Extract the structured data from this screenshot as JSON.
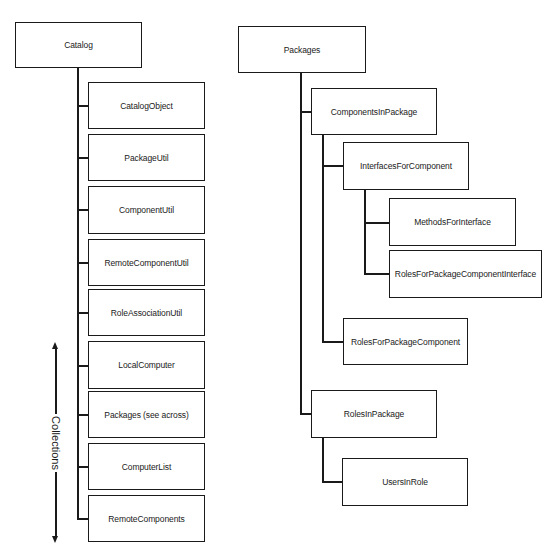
{
  "catalog_tree": {
    "root": "Catalog",
    "children": [
      "CatalogObject",
      "PackageUtil",
      "ComponentUtil",
      "RemoteComponentUtil",
      "RoleAssociationUtil",
      "LocalComputer",
      "Packages (see across)",
      "ComputerList",
      "RemoteComponents"
    ],
    "collections_label": "Collections"
  },
  "packages_tree": {
    "root": "Packages",
    "components_in_package": "ComponentsInPackage",
    "interfaces_for_component": "InterfacesForComponent",
    "methods_for_interface": "MethodsForInterface",
    "roles_for_package_component_interface": "RolesForPackageComponentInterface",
    "roles_for_package_component": "RolesForPackageComponent",
    "roles_in_package": "RolesInPackage",
    "users_in_role": "UsersInRole"
  }
}
